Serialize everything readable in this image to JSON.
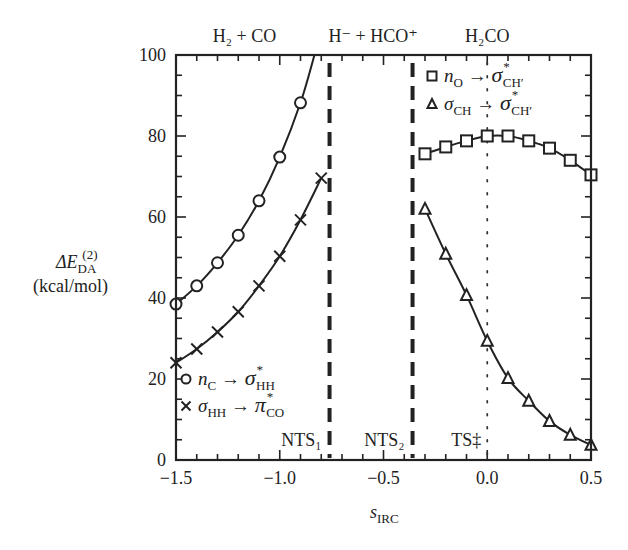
{
  "chart_data": {
    "type": "line",
    "title": "",
    "xlabel": "s_IRC",
    "xlabel_main": "s",
    "xlabel_sub": "IRC",
    "ylabel": "ΔE_DA^(2) (kcal/mol)",
    "ylabel_main": "ΔE",
    "ylabel_sub": "DA",
    "ylabel_sup": "(2)",
    "ylabel_units": "(kcal/mol)",
    "xlim": [
      -1.5,
      0.5
    ],
    "ylim": [
      0,
      100
    ],
    "xticks": [
      -1.5,
      -1.0,
      -0.5,
      0.0,
      0.5
    ],
    "xtick_labels": [
      "−1.5",
      "−1.0",
      "−0.5",
      "0.0",
      "0.5"
    ],
    "yticks": [
      0,
      20,
      40,
      60,
      80,
      100
    ],
    "ytick_labels": [
      "0",
      "20",
      "40",
      "60",
      "80",
      "100"
    ],
    "grid": false,
    "region_labels": [
      {
        "text": "H₂ + CO",
        "x": -1.17
      },
      {
        "text": "H⁻ + HCO⁺",
        "x": -0.55
      },
      {
        "text": "H₂CO",
        "x": 0.0
      }
    ],
    "vertical_lines": [
      {
        "x": -0.76,
        "style": "dashed",
        "label": "NTS₁"
      },
      {
        "x": -0.36,
        "style": "dashed",
        "label": "NTS₂"
      },
      {
        "x": 0.0,
        "style": "dotted",
        "label": "TS‡"
      }
    ],
    "series": [
      {
        "name": "n_C → σ*_HH",
        "marker": "circle",
        "x": [
          -1.5,
          -1.4,
          -1.3,
          -1.2,
          -1.1,
          -1.0,
          -0.9
        ],
        "y": [
          38.5,
          43.0,
          48.7,
          55.5,
          64.0,
          74.8,
          88.2
        ],
        "curve_end": [
          -0.83,
          100
        ]
      },
      {
        "name": "σ_HH → π*_CO",
        "marker": "cross",
        "x": [
          -1.5,
          -1.4,
          -1.3,
          -1.2,
          -1.1,
          -1.0,
          -0.9,
          -0.8
        ],
        "y": [
          24.0,
          27.4,
          31.6,
          36.6,
          43.0,
          50.3,
          59.3,
          69.6
        ]
      },
      {
        "name": "n_O → σ*_CH'",
        "marker": "square",
        "x": [
          -0.3,
          -0.2,
          -0.1,
          0.0,
          0.1,
          0.2,
          0.3,
          0.4,
          0.5
        ],
        "y": [
          75.6,
          77.3,
          78.8,
          80.0,
          80.0,
          78.8,
          77.0,
          74.0,
          70.4
        ]
      },
      {
        "name": "σ_CH → σ*_CH'",
        "marker": "triangle",
        "x": [
          -0.3,
          -0.2,
          -0.1,
          0.0,
          0.1,
          0.2,
          0.3,
          0.4,
          0.5
        ],
        "y": [
          62.0,
          50.9,
          40.7,
          29.4,
          20.2,
          14.6,
          9.6,
          6.2,
          3.7
        ]
      }
    ],
    "legend": [
      {
        "marker": "circle",
        "main": "n",
        "sub": "C",
        "arrow": "→",
        "main2": "σ",
        "sup2": "*",
        "sub2": "HH",
        "position": "lower-left"
      },
      {
        "marker": "cross",
        "main": "σ",
        "sub": "HH",
        "arrow": "→",
        "main2": "π",
        "sup2": "*",
        "sub2": "CO",
        "position": "lower-left"
      },
      {
        "marker": "square",
        "main": "n",
        "sub": "O",
        "arrow": "→",
        "main2": "σ",
        "sup2": "*",
        "sub2": "CH′",
        "position": "upper-right"
      },
      {
        "marker": "triangle",
        "main": "σ",
        "sub": "CH",
        "arrow": "→",
        "main2": "σ",
        "sup2": "*",
        "sub2": "CH′",
        "position": "upper-right"
      }
    ]
  }
}
